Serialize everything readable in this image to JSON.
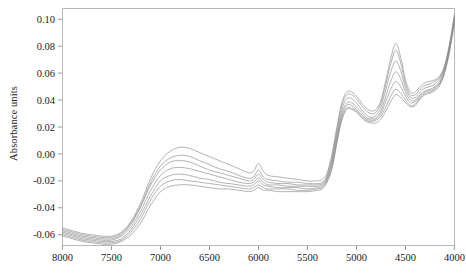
{
  "figure": {
    "background": "#ffffff",
    "line_color": "#8a8a8a",
    "frame_color": "#b9b9b9",
    "ylabel": "Absorbance units"
  },
  "chart_data": {
    "type": "line",
    "title": "",
    "xlabel": "",
    "ylabel": "Absorbance units",
    "xlim": [
      8000,
      4000
    ],
    "ylim": [
      -0.068,
      0.108
    ],
    "x_reversed": true,
    "grid": false,
    "legend": "none",
    "xticks": [
      8000,
      7500,
      7000,
      6500,
      6000,
      5500,
      5000,
      4500,
      4000
    ],
    "xticklabels": [
      "8000",
      "7500",
      "7000",
      "6500",
      "6000",
      "5500",
      "5000",
      "4500",
      "4000"
    ],
    "yticks": [
      0.1,
      0.08,
      0.06,
      0.04,
      0.02,
      0.0,
      -0.02,
      -0.04,
      -0.06
    ],
    "yticklabels": [
      "0.10",
      "0.08",
      "0.06",
      "0.04",
      "0.02",
      "0.00",
      "-0.02",
      "-0.04",
      "-0.06"
    ],
    "x": [
      8000,
      7900,
      7800,
      7700,
      7600,
      7500,
      7400,
      7300,
      7200,
      7100,
      7000,
      6900,
      6800,
      6700,
      6600,
      6500,
      6400,
      6300,
      6200,
      6100,
      6050,
      6000,
      5950,
      5900,
      5800,
      5700,
      5600,
      5500,
      5400,
      5350,
      5300,
      5250,
      5200,
      5150,
      5100,
      5050,
      5000,
      4950,
      4900,
      4850,
      4800,
      4750,
      4700,
      4650,
      4600,
      4550,
      4500,
      4450,
      4400,
      4350,
      4300,
      4250,
      4200,
      4150,
      4100,
      4050,
      4000
    ],
    "series": [
      {
        "name": "spectrum-1",
        "values": [
          -0.055,
          -0.057,
          -0.059,
          -0.06,
          -0.061,
          -0.061,
          -0.058,
          -0.05,
          -0.036,
          -0.018,
          -0.005,
          0.002,
          0.005,
          0.004,
          0.001,
          -0.002,
          -0.005,
          -0.008,
          -0.011,
          -0.014,
          -0.013,
          -0.007,
          -0.013,
          -0.016,
          -0.017,
          -0.018,
          -0.019,
          -0.02,
          -0.02,
          -0.019,
          -0.014,
          0.0,
          0.02,
          0.038,
          0.046,
          0.046,
          0.043,
          0.038,
          0.034,
          0.032,
          0.033,
          0.04,
          0.055,
          0.071,
          0.082,
          0.072,
          0.055,
          0.046,
          0.046,
          0.05,
          0.053,
          0.054,
          0.055,
          0.058,
          0.066,
          0.082,
          0.104
        ]
      },
      {
        "name": "spectrum-2",
        "values": [
          -0.056,
          -0.058,
          -0.06,
          -0.061,
          -0.062,
          -0.062,
          -0.059,
          -0.051,
          -0.038,
          -0.021,
          -0.009,
          -0.003,
          -0.001,
          -0.002,
          -0.005,
          -0.008,
          -0.011,
          -0.013,
          -0.016,
          -0.018,
          -0.017,
          -0.012,
          -0.017,
          -0.019,
          -0.02,
          -0.021,
          -0.021,
          -0.022,
          -0.022,
          -0.021,
          -0.016,
          -0.002,
          0.018,
          0.036,
          0.044,
          0.044,
          0.041,
          0.036,
          0.032,
          0.03,
          0.031,
          0.038,
          0.052,
          0.067,
          0.077,
          0.068,
          0.052,
          0.044,
          0.044,
          0.048,
          0.051,
          0.052,
          0.054,
          0.057,
          0.065,
          0.081,
          0.103
        ]
      },
      {
        "name": "spectrum-3",
        "values": [
          -0.057,
          -0.059,
          -0.061,
          -0.062,
          -0.063,
          -0.063,
          -0.06,
          -0.052,
          -0.039,
          -0.023,
          -0.012,
          -0.006,
          -0.005,
          -0.006,
          -0.009,
          -0.012,
          -0.014,
          -0.016,
          -0.018,
          -0.02,
          -0.019,
          -0.015,
          -0.019,
          -0.021,
          -0.022,
          -0.022,
          -0.023,
          -0.023,
          -0.023,
          -0.022,
          -0.017,
          -0.004,
          0.015,
          0.033,
          0.041,
          0.041,
          0.038,
          0.033,
          0.029,
          0.027,
          0.029,
          0.035,
          0.048,
          0.061,
          0.069,
          0.062,
          0.049,
          0.042,
          0.042,
          0.046,
          0.049,
          0.05,
          0.052,
          0.056,
          0.064,
          0.08,
          0.102
        ]
      },
      {
        "name": "spectrum-4",
        "values": [
          -0.058,
          -0.06,
          -0.062,
          -0.063,
          -0.064,
          -0.064,
          -0.061,
          -0.054,
          -0.042,
          -0.027,
          -0.016,
          -0.011,
          -0.01,
          -0.011,
          -0.013,
          -0.015,
          -0.017,
          -0.019,
          -0.021,
          -0.022,
          -0.021,
          -0.018,
          -0.021,
          -0.023,
          -0.023,
          -0.024,
          -0.024,
          -0.024,
          -0.024,
          -0.023,
          -0.018,
          -0.006,
          0.013,
          0.03,
          0.038,
          0.038,
          0.035,
          0.031,
          0.027,
          0.026,
          0.027,
          0.032,
          0.043,
          0.054,
          0.061,
          0.056,
          0.046,
          0.04,
          0.04,
          0.044,
          0.047,
          0.048,
          0.05,
          0.054,
          0.063,
          0.079,
          0.101
        ]
      },
      {
        "name": "spectrum-5",
        "values": [
          -0.059,
          -0.061,
          -0.063,
          -0.064,
          -0.065,
          -0.065,
          -0.063,
          -0.056,
          -0.045,
          -0.031,
          -0.02,
          -0.016,
          -0.015,
          -0.016,
          -0.018,
          -0.019,
          -0.021,
          -0.022,
          -0.023,
          -0.024,
          -0.023,
          -0.02,
          -0.023,
          -0.024,
          -0.025,
          -0.025,
          -0.025,
          -0.026,
          -0.025,
          -0.024,
          -0.019,
          -0.008,
          0.011,
          0.028,
          0.036,
          0.036,
          0.033,
          0.029,
          0.026,
          0.025,
          0.026,
          0.03,
          0.039,
          0.048,
          0.054,
          0.05,
          0.043,
          0.038,
          0.039,
          0.043,
          0.046,
          0.047,
          0.049,
          0.053,
          0.062,
          0.078,
          0.1
        ]
      },
      {
        "name": "spectrum-6",
        "values": [
          -0.06,
          -0.062,
          -0.064,
          -0.065,
          -0.066,
          -0.066,
          -0.064,
          -0.058,
          -0.048,
          -0.034,
          -0.024,
          -0.02,
          -0.019,
          -0.02,
          -0.021,
          -0.022,
          -0.023,
          -0.024,
          -0.025,
          -0.026,
          -0.025,
          -0.023,
          -0.025,
          -0.026,
          -0.026,
          -0.026,
          -0.027,
          -0.027,
          -0.026,
          -0.025,
          -0.02,
          -0.01,
          0.009,
          0.026,
          0.034,
          0.034,
          0.032,
          0.028,
          0.025,
          0.024,
          0.025,
          0.028,
          0.035,
          0.043,
          0.048,
          0.045,
          0.04,
          0.036,
          0.037,
          0.042,
          0.045,
          0.046,
          0.048,
          0.052,
          0.061,
          0.077,
          0.099
        ]
      },
      {
        "name": "spectrum-7",
        "values": [
          -0.061,
          -0.063,
          -0.065,
          -0.066,
          -0.067,
          -0.067,
          -0.065,
          -0.06,
          -0.051,
          -0.038,
          -0.028,
          -0.024,
          -0.023,
          -0.023,
          -0.024,
          -0.025,
          -0.026,
          -0.026,
          -0.027,
          -0.028,
          -0.027,
          -0.025,
          -0.027,
          -0.027,
          -0.028,
          -0.028,
          -0.028,
          -0.028,
          -0.027,
          -0.026,
          -0.021,
          -0.011,
          0.008,
          0.025,
          0.033,
          0.033,
          0.031,
          0.027,
          0.024,
          0.023,
          0.023,
          0.026,
          0.032,
          0.039,
          0.044,
          0.042,
          0.038,
          0.035,
          0.036,
          0.041,
          0.044,
          0.045,
          0.047,
          0.051,
          0.06,
          0.076,
          0.098
        ]
      }
    ]
  }
}
